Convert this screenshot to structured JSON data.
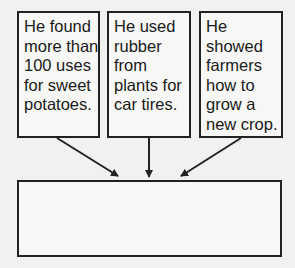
{
  "diagram": {
    "type": "graphic-organizer",
    "facts": [
      {
        "lines": [
          "He found",
          "more than",
          "100 uses",
          "for sweet",
          "potatoes."
        ]
      },
      {
        "lines": [
          "He used",
          "rubber",
          "from",
          "plants for",
          "car tires."
        ]
      },
      {
        "lines": [
          "He",
          "showed",
          "farmers",
          "how to",
          "grow a",
          "new crop."
        ]
      }
    ],
    "answer_box": {
      "text": ""
    },
    "colors": {
      "border": "#222222",
      "background": "#f1f1ef",
      "text": "#1a1a1a"
    }
  }
}
